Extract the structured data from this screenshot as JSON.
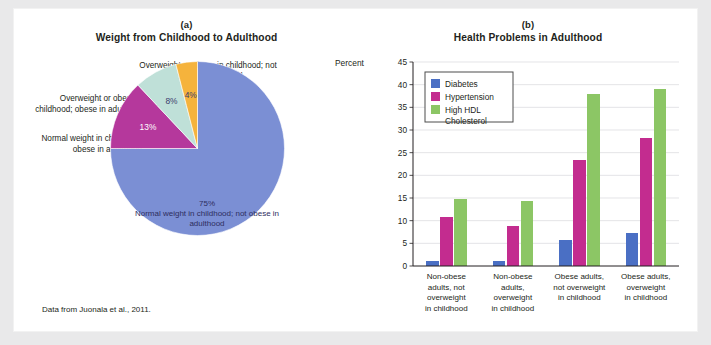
{
  "figure": {
    "source_note": "Data from Juonala et al., 2011."
  },
  "panel_a": {
    "letter": "(a)",
    "title": "Weight from Childhood to Adulthood",
    "callouts": {
      "top": "Overweight or obese in childhood; not obese in adulthood",
      "middle": "Overweight or obese in childhood; obese in adulthood",
      "lower": "Normal weight in childhood; obese in adulthood",
      "center_pct": "75%",
      "center_text": "Normal weight in childhood; not obese in adulthood"
    }
  },
  "panel_b": {
    "letter": "(b)",
    "title": "Health Problems in Adulthood",
    "y_axis_title": "Percent"
  },
  "colors": {
    "pie_blue": "#7b8fd4",
    "pie_magenta": "#b5389c",
    "pie_mint": "#bfe0d8",
    "pie_orange": "#f5b33c",
    "bar_blue": "#4a6fc4",
    "bar_magenta": "#c32c8f",
    "bar_green": "#8cc665",
    "grid": "#d9d9dd",
    "axis": "#231f20",
    "panel_bg": "#ffffff",
    "page_bg": "#e9e9ea"
  },
  "chart_data": [
    {
      "type": "pie",
      "title": "Weight from Childhood to Adulthood",
      "labels": [
        "Normal weight in childhood; not obese in adulthood",
        "Normal weight in childhood; obese in adulthood",
        "Overweight or obese in childhood; obese in adulthood",
        "Overweight or obese in childhood; not obese in adulthood"
      ],
      "values": [
        75,
        13,
        8,
        4
      ],
      "value_labels": [
        "75%",
        "13%",
        "8%",
        "4%"
      ],
      "colors": [
        "#7b8fd4",
        "#b5389c",
        "#bfe0d8",
        "#f5b33c"
      ],
      "legend": "callout-labels",
      "source": "Data from Juonala et al., 2011."
    },
    {
      "type": "bar",
      "title": "Health Problems in Adulthood",
      "xlabel": "",
      "ylabel": "Percent",
      "ylim": [
        0,
        45
      ],
      "yticks": [
        0,
        5,
        10,
        15,
        20,
        25,
        30,
        35,
        40,
        45
      ],
      "grid": true,
      "legend_position": "top-left",
      "categories": [
        "Non-obese adults, not overweight in childhood",
        "Non-obese adults, overweight in childhood",
        "Obese adults, not overweight in childhood",
        "Obese adults, overweight in childhood"
      ],
      "category_lines": [
        [
          "Non-obese",
          "adults, not",
          "overweight",
          "in childhood"
        ],
        [
          "Non-obese",
          "adults,",
          "overweight",
          "in childhood"
        ],
        [
          "Obese adults,",
          "not overweight",
          "in childhood"
        ],
        [
          "Obese adults,",
          "overweight",
          "in childhood"
        ]
      ],
      "series": [
        {
          "name": "Diabetes",
          "color": "#4a6fc4",
          "values": [
            1.2,
            1.2,
            5.7,
            7.3
          ]
        },
        {
          "name": "Hypertension",
          "color": "#c32c8f",
          "values": [
            10.9,
            8.8,
            23.5,
            28.3
          ]
        },
        {
          "name": "High HDL Cholesterol",
          "color": "#8cc665",
          "values": [
            14.9,
            14.3,
            38.0,
            39.1
          ]
        }
      ],
      "legend_entries": [
        {
          "label": "Diabetes",
          "color": "#4a6fc4"
        },
        {
          "label": "Hypertension",
          "color": "#c32c8f"
        },
        {
          "label": "High HDL",
          "label2": "Cholesterol",
          "color": "#8cc665"
        }
      ]
    }
  ]
}
